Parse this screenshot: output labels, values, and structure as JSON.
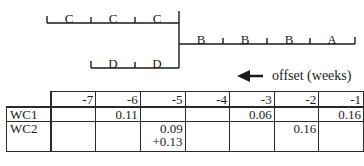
{
  "diagram": {
    "top_segments": [
      "C",
      "C",
      "C"
    ],
    "middle_segments": [
      "D",
      "D"
    ],
    "right_segments": [
      "B",
      "B",
      "B",
      "A"
    ],
    "arrow_label": "offset (weeks)",
    "arrow_direction": "left"
  },
  "table": {
    "columns": [
      "-7",
      "-6",
      "-5",
      "-4",
      "-3",
      "-2",
      "-1"
    ],
    "rows": [
      {
        "label": "WC1",
        "cells": [
          "",
          "0.11",
          "",
          "",
          "0.06",
          "",
          "0.16"
        ]
      },
      {
        "label": "WC2",
        "cells": [
          "",
          "",
          "0.09\n+0.13",
          "",
          "",
          "0.16",
          ""
        ]
      }
    ],
    "wc2_col5_line1": "0.09",
    "wc2_col5_line2": "+0.13"
  }
}
